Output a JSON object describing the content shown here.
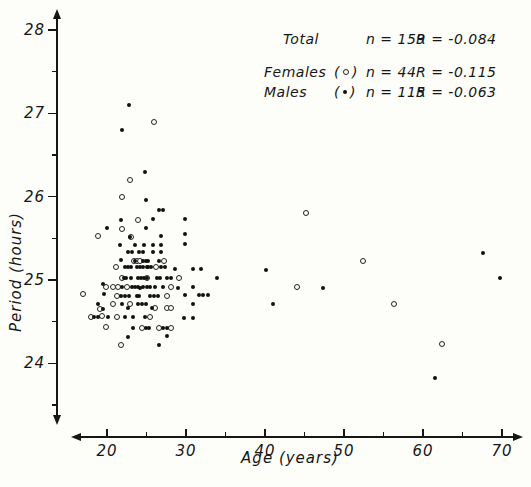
{
  "figure": {
    "background": "#fdfdfa",
    "ink_color": "#161616"
  },
  "legend": {
    "rows": [
      {
        "label": "Total",
        "marker": "none",
        "open_paren": "(",
        "close_paren": ")",
        "n": "n = 159",
        "r": "R = -0.084"
      },
      {
        "label": "Females",
        "marker": "open",
        "open_paren": "(",
        "close_paren": ")",
        "n": "n = 44",
        "r": "R = -0.115"
      },
      {
        "label": "Males",
        "marker": "filled",
        "open_paren": "(",
        "close_paren": ")",
        "n": "n = 115",
        "r": "R = -0.063"
      }
    ]
  },
  "axes": {
    "x_label": "Age (years)",
    "y_label": "Period (hours)",
    "x_major_ticks": [
      20,
      30,
      40,
      50,
      60,
      70
    ],
    "x_minor_ticks": [
      25,
      35,
      45,
      55,
      65
    ],
    "y_major_ticks": [
      24,
      25,
      26,
      27,
      28
    ],
    "y_minor_ticks": [
      23.5,
      24.5,
      25.5,
      26.5,
      27.5
    ],
    "x_range_shown": [
      16,
      72
    ],
    "y_range_shown": [
      23.4,
      28.2
    ]
  },
  "chart_data": {
    "type": "scatter",
    "title": "",
    "xlabel": "Age (years)",
    "ylabel": "Period (hours)",
    "xlim": [
      15,
      72
    ],
    "ylim": [
      23.4,
      28.2
    ],
    "grid": false,
    "legend_position": "top-right",
    "series": [
      {
        "name": "Females",
        "marker": "open-circle",
        "n": 44,
        "R": -0.115,
        "points": [
          [
            25.9,
            26.9
          ],
          [
            22.9,
            26.2
          ],
          [
            21.9,
            26.0
          ],
          [
            23.9,
            25.72
          ],
          [
            21.9,
            25.61
          ],
          [
            18.9,
            25.53
          ],
          [
            23.0,
            25.52
          ],
          [
            23.4,
            25.23
          ],
          [
            23.8,
            25.23
          ],
          [
            24.2,
            25.23
          ],
          [
            27.2,
            25.23
          ],
          [
            21.1,
            25.15
          ],
          [
            26.2,
            25.15
          ],
          [
            21.9,
            25.02
          ],
          [
            25.0,
            25.02
          ],
          [
            29.1,
            25.02
          ],
          [
            19.9,
            24.92
          ],
          [
            20.8,
            24.92
          ],
          [
            21.4,
            24.92
          ],
          [
            22.5,
            24.92
          ],
          [
            28.1,
            24.92
          ],
          [
            21.3,
            24.81
          ],
          [
            27.6,
            24.81
          ],
          [
            17.0,
            24.83
          ],
          [
            20.8,
            24.71
          ],
          [
            22.9,
            24.71
          ],
          [
            19.1,
            24.65
          ],
          [
            26.1,
            24.66
          ],
          [
            27.6,
            24.66
          ],
          [
            28.1,
            24.66
          ],
          [
            19.4,
            24.57
          ],
          [
            18.0,
            24.56
          ],
          [
            21.3,
            24.56
          ],
          [
            25.4,
            24.56
          ],
          [
            19.9,
            24.44
          ],
          [
            24.4,
            24.42
          ],
          [
            26.6,
            24.42
          ],
          [
            28.1,
            24.42
          ],
          [
            21.8,
            24.22
          ],
          [
            45.2,
            25.8
          ],
          [
            52.4,
            25.23
          ],
          [
            44.1,
            24.92
          ],
          [
            56.3,
            24.71
          ],
          [
            62.4,
            24.23
          ]
        ]
      },
      {
        "name": "Males",
        "marker": "filled-circle",
        "n": 115,
        "R": -0.063,
        "points": [
          [
            22.8,
            27.1
          ],
          [
            21.9,
            26.8
          ],
          [
            24.8,
            26.3
          ],
          [
            24.9,
            25.96
          ],
          [
            26.6,
            25.84
          ],
          [
            27.1,
            25.84
          ],
          [
            21.8,
            25.72
          ],
          [
            25.8,
            25.73
          ],
          [
            29.9,
            25.73
          ],
          [
            20.0,
            25.62
          ],
          [
            24.9,
            25.62
          ],
          [
            22.9,
            25.52
          ],
          [
            26.8,
            25.53
          ],
          [
            29.9,
            25.55
          ],
          [
            21.6,
            25.42
          ],
          [
            23.5,
            25.42
          ],
          [
            24.7,
            25.42
          ],
          [
            25.8,
            25.42
          ],
          [
            26.8,
            25.42
          ],
          [
            29.9,
            25.43
          ],
          [
            22.7,
            25.34
          ],
          [
            23.2,
            25.34
          ],
          [
            24.0,
            25.34
          ],
          [
            24.5,
            25.33
          ],
          [
            25.8,
            25.33
          ],
          [
            26.8,
            25.33
          ],
          [
            21.8,
            25.24
          ],
          [
            23.6,
            25.23
          ],
          [
            24.6,
            25.23
          ],
          [
            24.9,
            25.23
          ],
          [
            25.2,
            25.23
          ],
          [
            26.6,
            25.23
          ],
          [
            22.3,
            25.15
          ],
          [
            22.7,
            25.15
          ],
          [
            23.0,
            25.15
          ],
          [
            23.8,
            25.15
          ],
          [
            24.2,
            25.15
          ],
          [
            24.6,
            25.15
          ],
          [
            25.0,
            25.15
          ],
          [
            25.2,
            25.15
          ],
          [
            25.6,
            25.15
          ],
          [
            26.8,
            25.15
          ],
          [
            27.3,
            25.15
          ],
          [
            28.6,
            25.13
          ],
          [
            30.9,
            25.13
          ],
          [
            31.9,
            25.13
          ],
          [
            40.1,
            25.12
          ],
          [
            22.1,
            25.02
          ],
          [
            22.4,
            25.02
          ],
          [
            23.0,
            25.02
          ],
          [
            23.9,
            25.02
          ],
          [
            24.3,
            25.02
          ],
          [
            24.7,
            25.02
          ],
          [
            25.1,
            25.02
          ],
          [
            26.3,
            25.02
          ],
          [
            26.7,
            25.02
          ],
          [
            27.6,
            25.02
          ],
          [
            28.1,
            25.02
          ],
          [
            33.9,
            25.02
          ],
          [
            19.5,
            24.95
          ],
          [
            21.9,
            24.92
          ],
          [
            23.2,
            24.92
          ],
          [
            23.5,
            24.92
          ],
          [
            23.9,
            24.92
          ],
          [
            24.2,
            24.9
          ],
          [
            24.6,
            24.92
          ],
          [
            25.1,
            24.92
          ],
          [
            25.5,
            24.92
          ],
          [
            26.1,
            24.92
          ],
          [
            27.1,
            24.92
          ],
          [
            29.0,
            24.9
          ],
          [
            30.9,
            24.92
          ],
          [
            19.6,
            24.83
          ],
          [
            21.8,
            24.81
          ],
          [
            22.3,
            24.81
          ],
          [
            22.8,
            24.81
          ],
          [
            23.8,
            24.81
          ],
          [
            24.1,
            24.81
          ],
          [
            25.4,
            24.81
          ],
          [
            25.9,
            24.81
          ],
          [
            26.5,
            24.81
          ],
          [
            29.9,
            24.82
          ],
          [
            31.6,
            24.82
          ],
          [
            32.2,
            24.82
          ],
          [
            32.8,
            24.82
          ],
          [
            18.9,
            24.71
          ],
          [
            21.9,
            24.71
          ],
          [
            23.9,
            24.71
          ],
          [
            24.4,
            24.71
          ],
          [
            24.9,
            24.71
          ],
          [
            30.9,
            24.71
          ],
          [
            41.0,
            24.71
          ],
          [
            47.3,
            24.9
          ],
          [
            19.5,
            24.65
          ],
          [
            22.7,
            24.66
          ],
          [
            25.7,
            24.66
          ],
          [
            18.4,
            24.56
          ],
          [
            18.8,
            24.56
          ],
          [
            20.1,
            24.56
          ],
          [
            22.3,
            24.56
          ],
          [
            23.3,
            24.56
          ],
          [
            24.8,
            24.56
          ],
          [
            29.7,
            24.54
          ],
          [
            30.9,
            24.54
          ],
          [
            23.3,
            24.42
          ],
          [
            24.9,
            24.42
          ],
          [
            25.3,
            24.42
          ],
          [
            27.1,
            24.42
          ],
          [
            27.6,
            24.42
          ],
          [
            22.7,
            24.31
          ],
          [
            27.6,
            24.33
          ],
          [
            26.6,
            24.22
          ],
          [
            67.6,
            25.32
          ],
          [
            69.7,
            25.02
          ],
          [
            61.5,
            23.82
          ]
        ]
      }
    ]
  }
}
